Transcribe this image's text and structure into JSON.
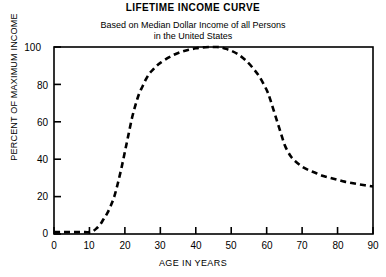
{
  "header": {
    "title": "LIFETIME INCOME CURVE",
    "subtitle_line1": "Based on Median Dollar Income of all Persons",
    "subtitle_line2": "in the United States"
  },
  "axes": {
    "ylabel": "PERCENT OF MAXIMUM INCOME",
    "xlabel": "AGE IN YEARS",
    "yticks": [
      "0",
      "20",
      "40",
      "60",
      "80",
      "100"
    ],
    "xticks": [
      "0",
      "10",
      "20",
      "30",
      "40",
      "50",
      "60",
      "70",
      "80",
      "90"
    ]
  },
  "colors": {
    "line": "#000000",
    "frame": "#000000",
    "background": "#ffffff"
  },
  "chart_data": {
    "type": "line",
    "title": "LIFETIME INCOME CURVE",
    "subtitle": "Based on Median Dollar Income of all Persons in the United States",
    "xlabel": "AGE IN YEARS",
    "ylabel": "PERCENT OF MAXIMUM INCOME",
    "xlim": [
      0,
      90
    ],
    "ylim": [
      0,
      100
    ],
    "xtick_values": [
      0,
      10,
      20,
      30,
      40,
      50,
      60,
      70,
      80,
      90
    ],
    "ytick_values": [
      0,
      20,
      40,
      60,
      80,
      100
    ],
    "grid": false,
    "legend": "none",
    "linestyle": "dashed",
    "series": [
      {
        "name": "Percent of maximum income",
        "x": [
          0,
          2,
          4,
          6,
          8,
          10,
          11,
          12,
          13,
          14,
          15,
          16,
          17,
          18,
          19,
          20,
          21,
          22,
          23,
          24,
          25,
          26,
          27,
          28,
          29,
          30,
          32,
          34,
          36,
          38,
          40,
          42,
          44,
          45,
          46,
          47,
          48,
          50,
          52,
          54,
          56,
          58,
          60,
          61,
          62,
          63,
          64,
          65,
          66,
          67,
          68,
          70,
          72,
          74,
          76,
          78,
          80,
          82,
          84,
          86,
          88,
          90
        ],
        "values": [
          1,
          1,
          1,
          1,
          1,
          1,
          1.5,
          3,
          5,
          8,
          11,
          15,
          20,
          27,
          35,
          44,
          53,
          62,
          69,
          75,
          79,
          83,
          86,
          88,
          90,
          91.5,
          94,
          96,
          97.5,
          98.5,
          99.3,
          99.8,
          100,
          100,
          100,
          99.8,
          99.3,
          98,
          96,
          93,
          89,
          84,
          77,
          72,
          66,
          60,
          54,
          48,
          44,
          41,
          39,
          36,
          34,
          32.5,
          31,
          30,
          29,
          28,
          27.3,
          26.6,
          26,
          25.4
        ]
      }
    ]
  }
}
